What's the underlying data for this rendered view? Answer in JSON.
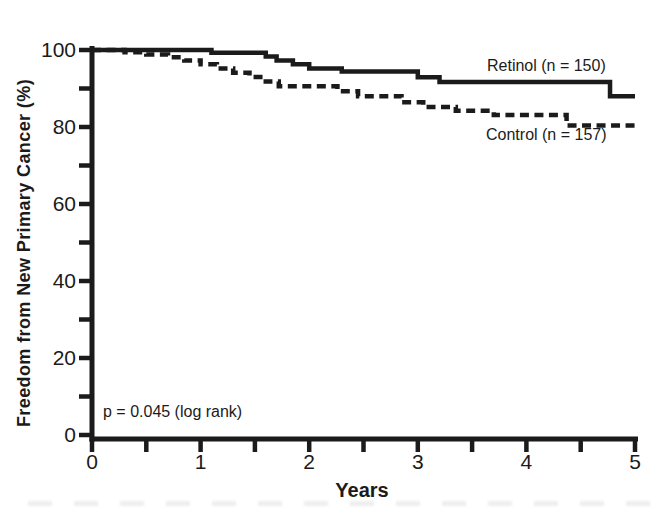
{
  "figure": {
    "background": "#ffffff",
    "ink_color": "#1b1b1b"
  },
  "chart_data": {
    "type": "line",
    "chart_kind": "kaplan-meier-step-curves",
    "title": "",
    "xlabel": "Years",
    "ylabel": "Freedom from New Primary Cancer (%)",
    "xlim": [
      0,
      5
    ],
    "ylim": [
      0,
      100
    ],
    "x_major_ticks": [
      0,
      1,
      2,
      3,
      4,
      5
    ],
    "x_minor_ticks": [
      0.5,
      1.5,
      2.5,
      3.5,
      4.5
    ],
    "y_major_ticks": [
      0,
      20,
      40,
      60,
      80,
      100
    ],
    "y_minor_ticks": [
      10,
      30,
      50,
      70,
      90
    ],
    "grid": false,
    "legend_position": "inline curve labels",
    "annotation": "p = 0.045 (log rank)",
    "series": [
      {
        "name": "Retinol",
        "label": "Retinol (n = 150)",
        "n": 150,
        "line_style": "solid",
        "points": [
          [
            0,
            100
          ],
          [
            1.1,
            99.3
          ],
          [
            1.6,
            98.3
          ],
          [
            1.7,
            97.3
          ],
          [
            1.85,
            96.3
          ],
          [
            2.0,
            95.2
          ],
          [
            2.3,
            94.4
          ],
          [
            3.0,
            92.9
          ],
          [
            3.2,
            91.7
          ],
          [
            4.77,
            88.0
          ],
          [
            5,
            88.0
          ]
        ]
      },
      {
        "name": "Control",
        "label": "Control (n = 157)",
        "n": 157,
        "line_style": "dashed",
        "points": [
          [
            0,
            100
          ],
          [
            0.3,
            99.4
          ],
          [
            0.5,
            98.8
          ],
          [
            0.7,
            98.1
          ],
          [
            0.85,
            97.3
          ],
          [
            1.0,
            96.3
          ],
          [
            1.15,
            95.2
          ],
          [
            1.3,
            94.1
          ],
          [
            1.45,
            93.0
          ],
          [
            1.6,
            91.8
          ],
          [
            1.72,
            90.6
          ],
          [
            2.26,
            89.3
          ],
          [
            2.45,
            88.0
          ],
          [
            2.85,
            86.4
          ],
          [
            3.05,
            85.2
          ],
          [
            3.35,
            84.2
          ],
          [
            3.7,
            83.1
          ],
          [
            4.37,
            80.4
          ],
          [
            5,
            80.4
          ]
        ]
      }
    ]
  }
}
